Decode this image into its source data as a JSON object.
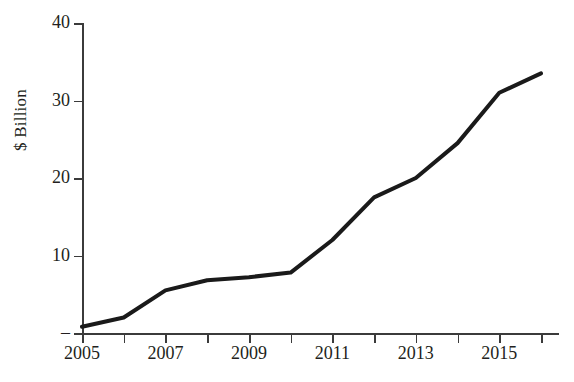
{
  "chart_data": {
    "type": "line",
    "title": "",
    "subtitle": "",
    "xlabel": "",
    "ylabel": "$ Billion",
    "x": [
      2005,
      2006,
      2007,
      2008,
      2009,
      2010,
      2011,
      2012,
      2013,
      2014,
      2015,
      2016
    ],
    "values": [
      0.8,
      2.0,
      5.5,
      6.8,
      7.2,
      7.8,
      12.0,
      17.5,
      20.0,
      24.5,
      31.0,
      33.5
    ],
    "series": [
      {
        "name": "",
        "values": [
          0.8,
          2.0,
          5.5,
          6.8,
          7.2,
          7.8,
          12.0,
          17.5,
          20.0,
          24.5,
          31.0,
          33.5
        ]
      }
    ],
    "xlim": [
      2005,
      2016.4
    ],
    "ylim": [
      0,
      40
    ],
    "x_tick_values": [
      2005,
      2006,
      2007,
      2008,
      2009,
      2010,
      2011,
      2012,
      2013,
      2014,
      2015,
      2016
    ],
    "x_tick_labels": [
      "2005",
      "",
      "2007",
      "",
      "2009",
      "",
      "2011",
      "",
      "2013",
      "",
      "2015",
      ""
    ],
    "y_ticks": [
      {
        "value": 0,
        "label": "–"
      },
      {
        "value": 10,
        "label": "10"
      },
      {
        "value": 20,
        "label": "20"
      },
      {
        "value": 30,
        "label": "30"
      },
      {
        "value": 40,
        "label": "40"
      }
    ],
    "grid": false,
    "legend": false,
    "legend_position": "none",
    "line_color": "#1a1a1a",
    "line_width": 4,
    "axis_color": "#3b3b3b",
    "background_color": "#ffffff"
  },
  "axis": {
    "y_title": "$ Billion"
  }
}
